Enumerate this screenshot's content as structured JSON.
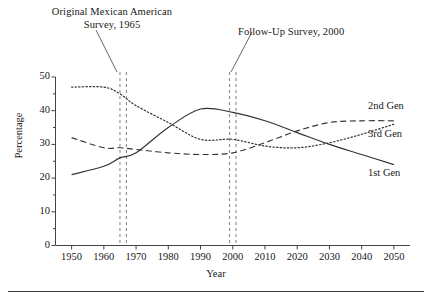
{
  "chart_data": {
    "type": "line",
    "title": "",
    "xlabel": "Year",
    "ylabel": "Percentage",
    "xlim": [
      1945,
      2055
    ],
    "ylim": [
      0,
      50
    ],
    "grid": false,
    "legend_position": "right-inline",
    "x_ticks": [
      1950,
      1960,
      1970,
      1980,
      1990,
      2000,
      2010,
      2020,
      2030,
      2040,
      2050
    ],
    "y_ticks": [
      0,
      10,
      20,
      30,
      40,
      50
    ],
    "y_minor_ticks": [
      5,
      15,
      25,
      35,
      45
    ],
    "x": [
      1950,
      1960,
      1965,
      1970,
      1980,
      1990,
      2000,
      2010,
      2020,
      2030,
      2040,
      2050
    ],
    "series": [
      {
        "name": "1st Gen",
        "style": "solid",
        "values": [
          21.0,
          23.5,
          26.0,
          27.5,
          35.0,
          40.5,
          39.5,
          37.0,
          33.5,
          30.0,
          27.0,
          24.0
        ]
      },
      {
        "name": "2nd Gen",
        "style": "dashed",
        "values": [
          32.0,
          29.0,
          29.0,
          28.5,
          27.5,
          27.0,
          27.5,
          30.5,
          34.0,
          36.5,
          37.0,
          37.0
        ]
      },
      {
        "name": "3rd Gen",
        "style": "dotted",
        "values": [
          47.0,
          47.0,
          45.0,
          41.5,
          36.5,
          31.5,
          31.5,
          29.5,
          29.0,
          30.5,
          33.0,
          36.0
        ]
      }
    ],
    "annotations": [
      {
        "id": "original-survey",
        "label_line1": "Original Mexican American",
        "label_line2": "Survey, 1965",
        "marker_years": [
          1965,
          1967
        ],
        "marker_style": "vertical-dashed"
      },
      {
        "id": "followup-survey",
        "label_line1": "Follow-Up Survey, 2000",
        "label_line2": "",
        "marker_years": [
          1999,
          2001
        ],
        "marker_style": "vertical-dashed"
      }
    ],
    "colors": {
      "line": "#333333",
      "axis": "#444444",
      "marker": "#8a8a8a",
      "text": "#202020",
      "rule": "#3a3a3a"
    }
  },
  "axis": {
    "y_title": "Percentage",
    "x_title": "Year",
    "y_tick_labels": [
      "0",
      "10",
      "20",
      "30",
      "40",
      "50"
    ],
    "x_tick_labels": [
      "1950",
      "1960",
      "1970",
      "1980",
      "1990",
      "2000",
      "2010",
      "2020",
      "2030",
      "2040",
      "2050"
    ]
  },
  "labels": {
    "gen1": "1st Gen",
    "gen2": "2nd Gen",
    "gen3": "3rd Gen"
  },
  "annotation1": {
    "line1": "Original Mexican American",
    "line2": "Survey, 1965"
  },
  "annotation2": {
    "line1": "Follow-Up Survey, 2000"
  }
}
